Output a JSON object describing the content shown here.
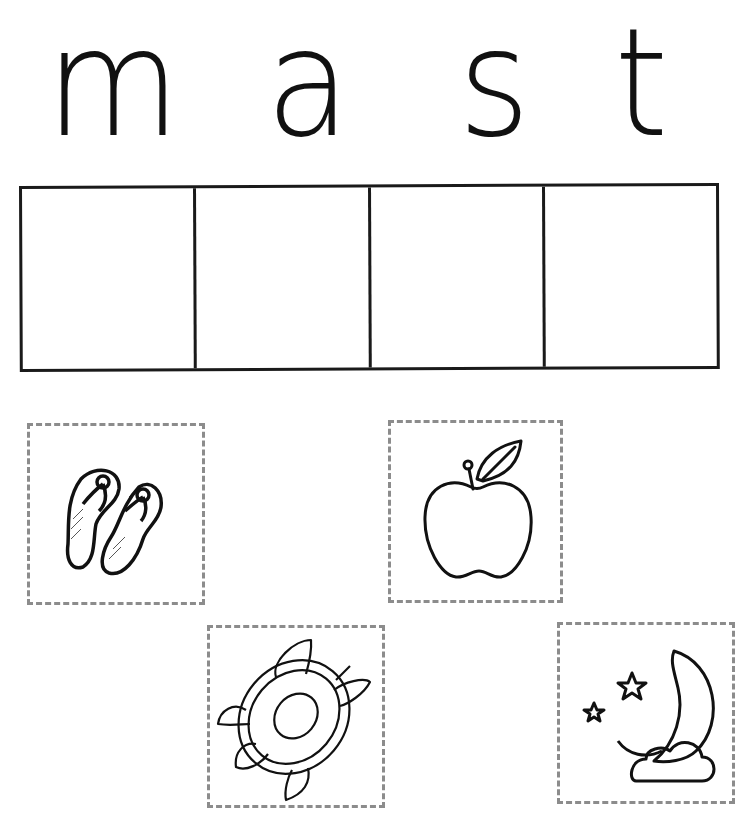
{
  "worksheet": {
    "word_letters": [
      "m",
      "a",
      "s",
      "t"
    ],
    "boxes_count": 4,
    "picture_cards": [
      {
        "name": "flip-flops",
        "icon": "flip-flops-icon"
      },
      {
        "name": "apple",
        "icon": "apple-icon"
      },
      {
        "name": "turtle",
        "icon": "turtle-icon"
      },
      {
        "name": "moon-and-stars",
        "icon": "moon-icon"
      }
    ]
  },
  "colors": {
    "ink": "#111111",
    "dashed_border": "#8c8c8c",
    "background": "#ffffff"
  }
}
